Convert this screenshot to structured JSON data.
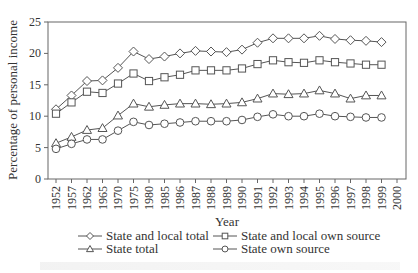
{
  "chart_data": {
    "type": "line",
    "title": "",
    "xlabel": "Year",
    "ylabel": "Percentage of personal income",
    "ylim": [
      0,
      25
    ],
    "yticks": [
      0,
      5,
      10,
      15,
      20,
      25
    ],
    "grid": false,
    "legend_position": "bottom",
    "categories": [
      "1952",
      "1957",
      "1962",
      "1965",
      "1970",
      "1975",
      "1980",
      "1985",
      "1986",
      "1987",
      "1988",
      "1989",
      "1990",
      "1991",
      "1992",
      "1993",
      "1994",
      "1995",
      "1996",
      "1997",
      "1998",
      "1999",
      "2000"
    ],
    "series": [
      {
        "name": "State and local total",
        "marker": "diamond",
        "values": [
          11.1,
          13.3,
          15.6,
          15.7,
          17.7,
          20.3,
          19.1,
          19.5,
          20.0,
          20.4,
          20.3,
          20.2,
          20.6,
          21.7,
          22.4,
          22.4,
          22.4,
          22.8,
          22.3,
          22.1,
          22.0,
          21.8,
          null
        ]
      },
      {
        "name": "State and local own source",
        "marker": "square",
        "values": [
          10.4,
          12.2,
          13.9,
          13.7,
          15.2,
          16.8,
          15.6,
          16.2,
          16.6,
          17.3,
          17.3,
          17.3,
          17.6,
          18.3,
          18.9,
          18.6,
          18.5,
          18.9,
          18.6,
          18.4,
          18.2,
          18.2,
          null
        ]
      },
      {
        "name": "State total",
        "marker": "triangle",
        "values": [
          5.7,
          6.7,
          7.8,
          8.1,
          10.1,
          12.0,
          11.5,
          11.8,
          12.0,
          12.0,
          11.9,
          12.0,
          12.2,
          12.8,
          13.6,
          13.5,
          13.6,
          14.1,
          13.6,
          12.8,
          13.3,
          13.3,
          null
        ]
      },
      {
        "name": "State own source",
        "marker": "circle",
        "values": [
          4.8,
          5.6,
          6.3,
          6.3,
          7.7,
          9.1,
          8.6,
          8.8,
          9.0,
          9.2,
          9.2,
          9.2,
          9.4,
          9.9,
          10.3,
          10.0,
          10.0,
          10.4,
          10.0,
          9.9,
          9.8,
          9.8,
          null
        ]
      }
    ]
  },
  "legend": {
    "items": [
      {
        "label": "State and local total",
        "marker": "diamond"
      },
      {
        "label": "State and local own source",
        "marker": "square"
      },
      {
        "label": "State total",
        "marker": "triangle"
      },
      {
        "label": "State own source",
        "marker": "circle"
      }
    ]
  },
  "colors": {
    "line": "#555555",
    "axis": "#666666",
    "marker_fill": "#ffffff"
  }
}
